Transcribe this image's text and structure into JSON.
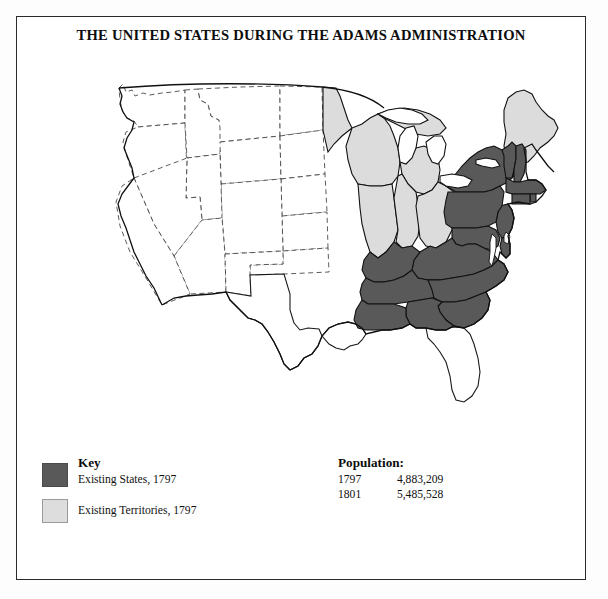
{
  "figure": {
    "title": "THE UNITED STATES DURING THE ADAMS ADMINISTRATION"
  },
  "legend": {
    "heading": "Key",
    "items": [
      {
        "label": "Existing States, 1797",
        "color": "#595959",
        "swatch": "dark-gray-swatch"
      },
      {
        "label": "Existing Territories, 1797",
        "color": "#dddddd",
        "swatch": "light-gray-swatch"
      }
    ]
  },
  "population": {
    "heading": "Population:",
    "rows": [
      {
        "year": "1797",
        "value": "4,883,209"
      },
      {
        "year": "1801",
        "value": "5,485,528"
      }
    ]
  },
  "map": {
    "colors": {
      "state_fill": "#595959",
      "territory_fill": "#dcdcdc",
      "unclaimed_fill": "#ffffff",
      "outline": "#111111",
      "future_border": "#444444"
    },
    "existing_states_1797": [
      "New Hampshire",
      "Vermont",
      "Massachusetts",
      "Rhode Island",
      "Connecticut",
      "New York",
      "New Jersey",
      "Pennsylvania",
      "Delaware",
      "Maryland",
      "Virginia",
      "North Carolina",
      "South Carolina",
      "Georgia",
      "Kentucky",
      "Tennessee"
    ],
    "existing_territories_1797": [
      "District of Maine",
      "Northwest Territory",
      "Mississippi Territory"
    ],
    "unclaimed_regions": [
      "Louisiana (Spanish)",
      "Florida (Spanish)",
      "Texas (Spanish)",
      "Western lands"
    ]
  }
}
